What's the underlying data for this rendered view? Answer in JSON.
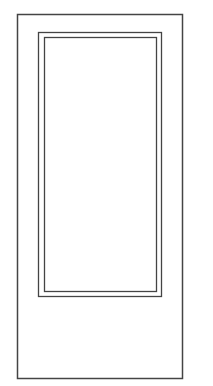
{
  "drawing": {
    "subject": "door-elevation",
    "stroke_color": "#444444",
    "background": "#ffffff",
    "door_frame": {
      "x": 17.5,
      "y": 14.5,
      "w": 165,
      "h": 364
    },
    "panel_outer": {
      "x": 38.5,
      "y": 32.5,
      "w": 123,
      "h": 264
    },
    "panel_inner": {
      "x": 44.5,
      "y": 37.5,
      "w": 112,
      "h": 254
    }
  }
}
